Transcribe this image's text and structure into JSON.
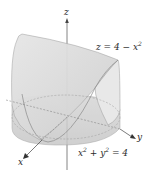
{
  "figure": {
    "axes": {
      "z_label": "z",
      "y_label": "y",
      "x_label": "x"
    },
    "equations": {
      "surface": {
        "lhs": "z = 4 − x",
        "exp": "2"
      },
      "cylinder": {
        "x": "x",
        "x_exp": "2",
        "mid": " + y",
        "y_exp": "2",
        "rhs": " = 4"
      }
    },
    "colors": {
      "surface_fill": "#dcdcdc",
      "surface_dark": "#c4c4c4",
      "edge": "#8a8a8a",
      "axis": "#555555",
      "background": "#ffffff"
    }
  }
}
